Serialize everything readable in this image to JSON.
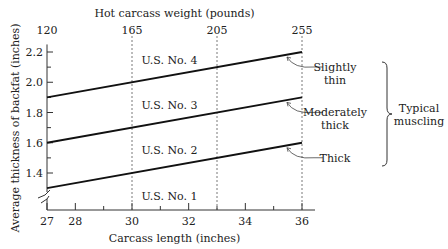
{
  "chart_data": {
    "type": "line",
    "title": "",
    "xlabel": "Carcass length (inches)",
    "ylabel": "Average thickness of backfat (inches)",
    "top_xlabel": "Hot carcass weight (pounds)",
    "xlim": [
      27,
      36
    ],
    "ylim": [
      1.2,
      2.25
    ],
    "x_ticks_major": [
      27,
      28,
      30,
      32,
      34,
      36
    ],
    "x_ticks_minor": [
      29,
      31,
      33,
      35
    ],
    "y_ticks_major": [
      1.4,
      1.6,
      1.8,
      2.0,
      2.2
    ],
    "y_ticks_minor": [
      1.5,
      1.7,
      1.9,
      2.1
    ],
    "top_axis": [
      {
        "x": 27,
        "label": "120"
      },
      {
        "x": 30,
        "label": "165"
      },
      {
        "x": 33,
        "label": "205"
      },
      {
        "x": 36,
        "label": "255"
      }
    ],
    "dashed_verticals": [
      30,
      33,
      36
    ],
    "series": [
      {
        "name": "Slightly thin",
        "x": [
          27,
          36
        ],
        "y": [
          1.9,
          2.2
        ]
      },
      {
        "name": "Moderately thick",
        "x": [
          27,
          36
        ],
        "y": [
          1.6,
          1.9
        ]
      },
      {
        "name": "Thick",
        "x": [
          27,
          36
        ],
        "y": [
          1.3,
          1.6
        ]
      }
    ],
    "regions": [
      {
        "label": "U.S. No. 4",
        "x": 31.5,
        "y": 2.15
      },
      {
        "label": "U.S. No. 3",
        "x": 31.5,
        "y": 1.85
      },
      {
        "label": "U.S. No. 2",
        "x": 31.5,
        "y": 1.55
      },
      {
        "label": "U.S. No. 1",
        "x": 31.5,
        "y": 1.25
      }
    ],
    "annotations": [
      {
        "series": 0,
        "lines": [
          "Slightly",
          "thin"
        ]
      },
      {
        "series": 1,
        "lines": [
          "Moderately",
          "thick"
        ]
      },
      {
        "series": 2,
        "lines": [
          "Thick"
        ]
      }
    ],
    "brace_label": [
      "Typical",
      "muscling"
    ],
    "grid": false,
    "legend": "none"
  }
}
